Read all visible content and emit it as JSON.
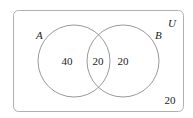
{
  "diagram": {
    "type": "venn",
    "universe_label": "U",
    "sets": [
      {
        "label": "A",
        "only_count": "40"
      },
      {
        "label": "B",
        "only_count": "20"
      }
    ],
    "intersection_count": "20",
    "outside_count": "20",
    "colors": {
      "stroke": "#9a9a9a",
      "text": "#222222",
      "background": "#ffffff"
    }
  }
}
